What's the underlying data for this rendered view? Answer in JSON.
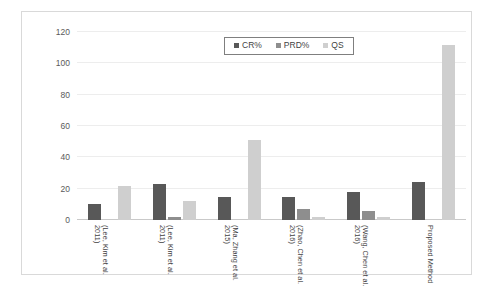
{
  "chart_data": {
    "type": "bar",
    "title": "",
    "xlabel": "",
    "ylabel": "",
    "ylim": [
      0,
      120
    ],
    "yticks": [
      0,
      20,
      40,
      60,
      80,
      100,
      120
    ],
    "grid": true,
    "legend_position": "top-center",
    "categories": [
      "(Lee, Kim et al. 2011)",
      "(Lee, Kim et al. 2011)",
      "(Ma, Zhang et al. 2015)",
      "(Zhao, Chen et al. 2016)",
      "(Wang, Chen et al. 2016)",
      "Proposed Method"
    ],
    "series": [
      {
        "name": "CR%",
        "color": "#585858",
        "values": [
          10,
          23,
          15,
          15,
          18,
          24
        ]
      },
      {
        "name": "PRD%",
        "color": "#8e8e8e",
        "values": [
          0,
          2,
          0,
          7,
          6,
          0
        ]
      },
      {
        "name": "QS",
        "color": "#cfcfcf",
        "values": [
          22,
          12,
          51,
          2,
          2,
          112
        ]
      }
    ]
  },
  "legend": {
    "items": [
      {
        "label": "CR%",
        "swatch": "legend-swatch-cr"
      },
      {
        "label": "PRD%",
        "swatch": "legend-swatch-prd"
      },
      {
        "label": "QS",
        "swatch": "legend-swatch-qs"
      }
    ]
  },
  "colors": {
    "series_cr": "#585858",
    "series_prd": "#8e8e8e",
    "series_qs": "#cfcfcf",
    "gridline": "#ededed",
    "axis": "#c9c9c9",
    "frame": "#d9d9d9",
    "legend_border": "#7f7f7f",
    "tick_text": "#5a5a5a",
    "label_text": "#3f3f3f"
  }
}
